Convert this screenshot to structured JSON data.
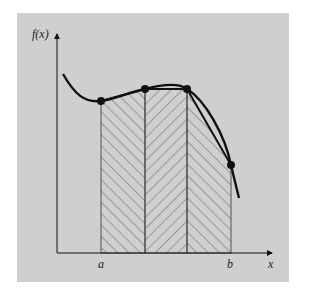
{
  "figure": {
    "y_axis_label": "f(x)",
    "x_axis_label": "x",
    "a_label": "a",
    "b_label": "b",
    "colors": {
      "panel": "#cfcfcf",
      "ink": "#111111",
      "hatch": "#444444"
    }
  },
  "points": [
    {
      "name": "p0",
      "x": 101,
      "y": 101
    },
    {
      "name": "p1",
      "x": 145,
      "y": 89
    },
    {
      "name": "p2",
      "x": 187,
      "y": 89
    },
    {
      "name": "p3",
      "x": 231,
      "y": 165
    }
  ]
}
